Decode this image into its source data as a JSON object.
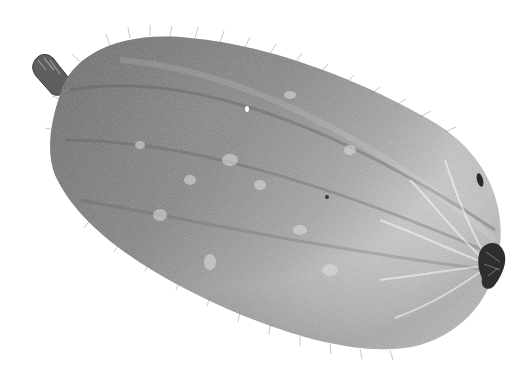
{
  "image": {
    "subject": "winter melon (fuzzy gourd)",
    "alt": "Grayscale photograph of a hairy winter melon lying diagonally on a white background, stem at upper left and blossom end at right",
    "colors": {
      "background": "#ffffff",
      "skin_dark": "#6a6a6a",
      "skin_mid": "#9a9a9a",
      "skin_light": "#e8e8e8",
      "stem": "#5a5a5a",
      "blossom_end": "#2e2e2e"
    }
  }
}
